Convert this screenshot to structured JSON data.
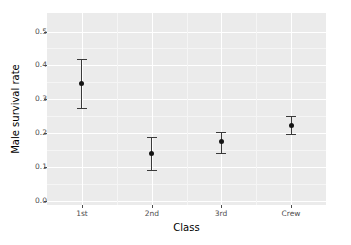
{
  "chart_data": {
    "type": "scatter",
    "subtype": "pointrange",
    "title": "",
    "xlabel": "Class",
    "ylabel": "Male survival rate",
    "categories": [
      "1st",
      "2nd",
      "3rd",
      "Crew"
    ],
    "values": [
      0.346,
      0.138,
      0.174,
      0.223
    ],
    "error_low": [
      0.273,
      0.09,
      0.141,
      0.196
    ],
    "error_high": [
      0.418,
      0.189,
      0.204,
      0.249
    ],
    "series": [
      {
        "name": "Male survival rate",
        "points": [
          {
            "category": "1st",
            "value": 0.346,
            "low": 0.273,
            "high": 0.418
          },
          {
            "category": "2nd",
            "value": 0.138,
            "low": 0.09,
            "high": 0.189
          },
          {
            "category": "3rd",
            "value": 0.174,
            "low": 0.141,
            "high": 0.204
          },
          {
            "category": "Crew",
            "value": 0.223,
            "low": 0.196,
            "high": 0.249
          }
        ]
      }
    ],
    "ylim": [
      -0.013,
      0.555
    ],
    "y_ticks": [
      0.0,
      0.1,
      0.2,
      0.3,
      0.4,
      0.5
    ],
    "y_tick_labels": [
      "0.0",
      "0.1",
      "0.2",
      "0.3",
      "0.4",
      "0.5"
    ],
    "y_minor_ticks": [
      0.05,
      0.15,
      0.25,
      0.35,
      0.45
    ],
    "grid": true,
    "legend": "none",
    "panel_background": "#ebebeb",
    "gridline_color": "#ffffff",
    "point_color": "#141414",
    "errorbar_color": "#3a3a3a",
    "plot_background": "#ffffff",
    "axis_text_color": "#4d4d4d",
    "axis_title_color": "#000000"
  }
}
